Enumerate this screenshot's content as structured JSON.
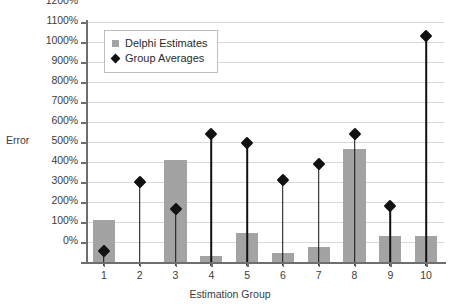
{
  "chart_data": {
    "type": "bar",
    "title": "",
    "xlabel": "Estimation Group",
    "ylabel": "Error",
    "categories": [
      "1",
      "2",
      "3",
      "4",
      "5",
      "6",
      "7",
      "8",
      "9",
      "10"
    ],
    "ylim": [
      0,
      1200
    ],
    "ytick_values": [
      0,
      100,
      200,
      300,
      400,
      500,
      600,
      700,
      800,
      900,
      1000,
      1100,
      1200
    ],
    "ytick_labels": [
      "0%",
      "100%",
      "200%",
      "300%",
      "400%",
      "500%",
      "600%",
      "700%",
      "800%",
      "900%",
      "1000%",
      "1100%",
      "1200%"
    ],
    "grid": true,
    "legend_position": "upper-left-inside",
    "series": [
      {
        "name": "Delphi Estimates",
        "kind": "bar",
        "color": "#a3a3a3",
        "values": [
          210,
          0,
          510,
          30,
          145,
          45,
          75,
          565,
          130,
          130
        ]
      },
      {
        "name": "Group Averages",
        "kind": "marker",
        "color": "#111111",
        "marker": "diamond",
        "values": [
          55,
          400,
          265,
          640,
          595,
          410,
          490,
          640,
          280,
          1130
        ]
      }
    ]
  },
  "legend": {
    "entries": [
      {
        "label": "Delphi Estimates",
        "swatch": "square-gray"
      },
      {
        "label": "Group Averages",
        "swatch": "diamond-black"
      }
    ]
  },
  "axes": {
    "y_title": "Error",
    "x_title": "Estimation Group"
  }
}
